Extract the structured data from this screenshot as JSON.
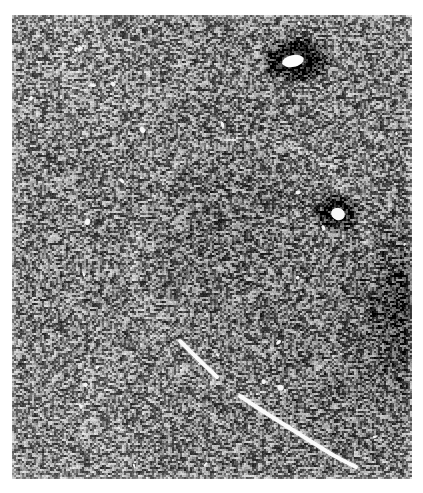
{
  "image": {
    "kind": "grayscale-micrograph",
    "description": "Grainy high-contrast black-and-white micrograph plate",
    "canvas_width": 423,
    "canvas_height": 493,
    "page_background": "#ffffff",
    "plate": {
      "left": 12,
      "top": 15,
      "width": 400,
      "height": 464,
      "mean_gray": "#7d7d7d",
      "noise_amplitude": 96,
      "grain_scale": 2
    },
    "background_gradients": [
      {
        "name": "right-edge-vignette",
        "cx": 1.04,
        "cy": 0.62,
        "radius": 0.3,
        "delta": -120
      },
      {
        "name": "upper-left-lift",
        "cx": 0.14,
        "cy": 0.1,
        "radius": 0.45,
        "delta": 16
      },
      {
        "name": "lower-left-lift",
        "cx": 0.18,
        "cy": 0.88,
        "radius": 0.42,
        "delta": 14
      },
      {
        "name": "center-dim",
        "cx": 0.52,
        "cy": 0.45,
        "radius": 0.4,
        "delta": -14
      },
      {
        "name": "bottom-right-dim",
        "cx": 0.8,
        "cy": 0.78,
        "radius": 0.38,
        "delta": -18
      }
    ],
    "features": {
      "ring": {
        "name": "faint-circular-halo",
        "center_x": 240,
        "center_y": 250,
        "radius_x": 118,
        "radius_y": 128,
        "stroke_width": 7,
        "brightness_delta": 26,
        "arc_start_deg": 120,
        "arc_end_deg": 470
      },
      "blobs": [
        {
          "name": "dark-blob-upper-right",
          "center_x": 284,
          "center_y": 44,
          "dark_radius_x": 28,
          "dark_radius_y": 19,
          "dark_value": 14,
          "core_x": 281,
          "core_y": 46,
          "core_radius_x": 11,
          "core_radius_y": 6,
          "core_value": 252,
          "core_angle_deg": -12
        },
        {
          "name": "dark-blob-mid-right",
          "center_x": 325,
          "center_y": 197,
          "dark_radius_x": 21,
          "dark_radius_y": 17,
          "dark_value": 36,
          "core_x": 326,
          "core_y": 199,
          "core_radius_x": 7,
          "core_radius_y": 6,
          "core_value": 248,
          "core_angle_deg": 20
        }
      ],
      "streak": {
        "name": "bright-diagonal-track",
        "points": [
          [
            168,
            326
          ],
          [
            186,
            344
          ],
          [
            205,
            362
          ],
          [
            228,
            381
          ],
          [
            252,
            397
          ],
          [
            276,
            412
          ],
          [
            300,
            427
          ],
          [
            322,
            441
          ],
          [
            344,
            452
          ]
        ],
        "width": 4,
        "value": 250,
        "gaps": [
          [
            0.3,
            0.36
          ],
          [
            0.62,
            0.66
          ]
        ]
      },
      "speckles": {
        "name": "bright-speckles",
        "count": 26,
        "value": 246,
        "radius": 2
      }
    }
  }
}
